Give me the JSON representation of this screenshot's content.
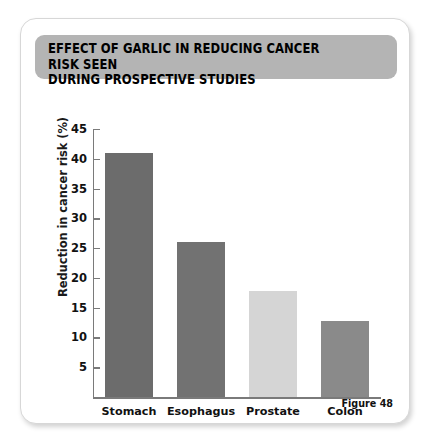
{
  "figure": {
    "title_line_1": "EFFECT OF GARLIC IN REDUCING CANCER RISK SEEN",
    "title_line_2": "DURING PROSPECTIVE STUDIES",
    "title_full": "EFFECT OF GARLIC IN REDUCING CANCER RISK SEEN\nDURING PROSPECTIVE STUDIES",
    "caption": "Figure 48",
    "banner_color": "#b4b4b4",
    "card_background": "#ffffff",
    "axis_color": "#7a7a7a"
  },
  "chart_data": {
    "type": "bar",
    "title": "EFFECT OF GARLIC IN REDUCING CANCER RISK SEEN DURING PROSPECTIVE STUDIES",
    "categories": [
      "Stomach",
      "Esophagus",
      "Prostate",
      "Colon"
    ],
    "values": [
      41,
      26,
      17.8,
      12.7
    ],
    "xlabel": "",
    "ylabel": "Reduction in cancer risk (%)",
    "ylim": [
      0,
      45
    ],
    "yticks": [
      5,
      10,
      15,
      20,
      25,
      30,
      35,
      40,
      45
    ],
    "ytick_labels": [
      "5",
      "10",
      "15",
      "20",
      "25",
      "30",
      "35",
      "40",
      "45"
    ],
    "grid": false,
    "legend": false,
    "bar_colors": [
      "#6c6c6c",
      "#727272",
      "#d5d5d5",
      "#8a8a8a"
    ]
  }
}
